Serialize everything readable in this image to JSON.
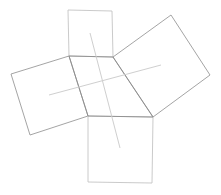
{
  "diagram": {
    "title": "",
    "type": "quadrilateral with squares on each side (Van Aubel configuration)",
    "colors": {
      "background": "#ffffff",
      "quadrilateral_stroke": "#8c8c8c",
      "square_stroke": "#9a9a9a",
      "light_square_stroke": "#c4c4c4",
      "center_line_stroke": "#cfcfcf"
    },
    "quadrilateral": {
      "points": "69,56 113,57 153,117 88,116"
    },
    "squares": [
      {
        "name": "top",
        "points": "69,56 113,57 112,11 68,10",
        "stroke": "#c4c4c4"
      },
      {
        "name": "right",
        "points": "113,57 153,117 210,75 171,15",
        "stroke": "#9a9a9a"
      },
      {
        "name": "left",
        "points": "69,56 88,116 30,135 11,74",
        "stroke": "#9a9a9a"
      },
      {
        "name": "bottom",
        "points": "88,116 153,117 152,183 88,182",
        "stroke": "#c4c4c4"
      }
    ],
    "center_lines": [
      {
        "name": "top-bottom",
        "x1": 90,
        "y1": 33,
        "x2": 120,
        "y2": 148
      },
      {
        "name": "left-right",
        "x1": 49,
        "y1": 95,
        "x2": 161,
        "y2": 65
      }
    ]
  }
}
